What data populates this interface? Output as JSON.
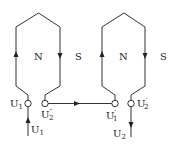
{
  "diagram": {
    "type": "winding-connection",
    "coils": [
      {
        "id": "coil-1",
        "poles": {
          "inner": "N",
          "outer": "S"
        },
        "terminals": {
          "start": {
            "label": "U",
            "sub": "1",
            "prime": ""
          },
          "end": {
            "label": "U",
            "sub": "2",
            "prime": "″"
          }
        }
      },
      {
        "id": "coil-2",
        "poles": {
          "inner": "N",
          "outer": "S"
        },
        "terminals": {
          "start": {
            "label": "U",
            "sub": "1",
            "prime": "′"
          },
          "end": {
            "label": "U",
            "sub": "2",
            "prime": "′"
          }
        }
      }
    ],
    "leads": {
      "input": {
        "label": "U",
        "sub": "1"
      },
      "output": {
        "label": "U",
        "sub": "2"
      }
    },
    "colors": {
      "line": "#333333",
      "text": "#222222",
      "background": "#ffffff"
    }
  }
}
